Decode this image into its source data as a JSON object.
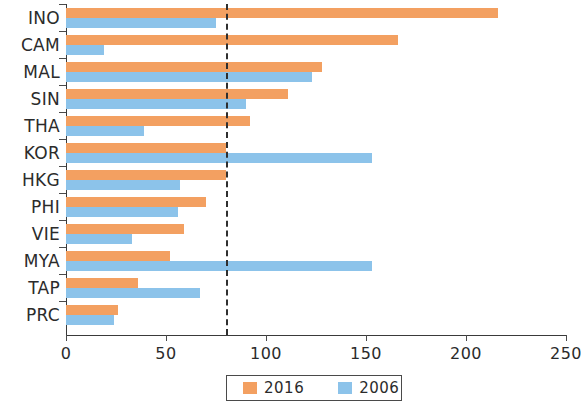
{
  "chart_data": {
    "type": "bar",
    "orientation": "horizontal",
    "title": "",
    "subtitle": "",
    "xlabel": "",
    "ylabel": "",
    "xlim": [
      0,
      250
    ],
    "ylim": null,
    "grid": false,
    "legend_position": "bottom",
    "categories": [
      "INO",
      "CAM",
      "MAL",
      "SIN",
      "THA",
      "KOR",
      "HKG",
      "PHI",
      "VIE",
      "MYA",
      "TAP",
      "PRC"
    ],
    "series": [
      {
        "name": "2016",
        "color": "#f3a061",
        "values": [
          216,
          166,
          128,
          111,
          92,
          80,
          80,
          70,
          59,
          52,
          36,
          26
        ]
      },
      {
        "name": "2006",
        "color": "#8cc3ea",
        "values": [
          75,
          19,
          123,
          90,
          39,
          153,
          57,
          56,
          33,
          153,
          67,
          24
        ]
      }
    ],
    "xticks": [
      0,
      50,
      100,
      150,
      200,
      250
    ],
    "xtick_labels": [
      "0",
      "50",
      "100",
      "150",
      "200",
      "250"
    ],
    "annotations": [
      {
        "type": "vertical-reference-line",
        "value": 80,
        "style": "dashed",
        "color": "#2f2f2f",
        "label": ""
      }
    ]
  },
  "legend": {
    "items": [
      {
        "label": "2016",
        "color": "#f3a061"
      },
      {
        "label": "2006",
        "color": "#8cc3ea"
      }
    ]
  },
  "colors": {
    "series_2016": "#f3a061",
    "series_2006": "#8cc3ea",
    "axis": "#3a3a3a",
    "reference_line": "#2f2f2f",
    "text": "#2b2b2b",
    "background": "#ffffff"
  }
}
